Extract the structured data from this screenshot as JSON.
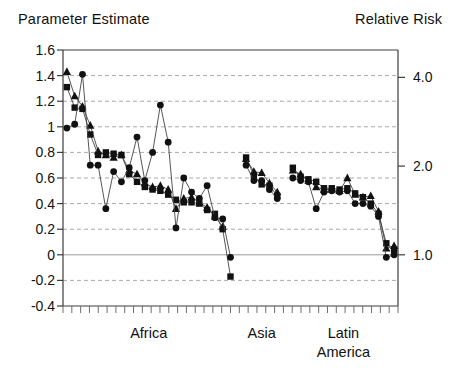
{
  "colors": {
    "background": "#ffffff",
    "ink": "#111111",
    "axis": "#3c3c3c",
    "grid": "#aaaaaa",
    "zero_line": "#979797"
  },
  "chart_data": {
    "type": "scatter",
    "title_left": "Parameter Estimate",
    "title_right": "Relative Risk",
    "y_axis_left": {
      "title": "Parameter Estimate",
      "range": [
        -0.4,
        1.6
      ],
      "tick_values": [
        1.6,
        1.4,
        1.2,
        1,
        0.8,
        0.6,
        0.4,
        0.2,
        0,
        -0.2,
        -0.4
      ],
      "tick_labels": [
        "1.6",
        "1.4",
        "1.2",
        "1",
        "0.8",
        "0.6",
        "0.4",
        "0.2",
        "0",
        "-0.2",
        "-0.4"
      ],
      "gridlines": "dashed at each 0.2 step, solid line at 0, solid border at 1.6 and -0.4"
    },
    "y_axis_right": {
      "title": "Relative Risk",
      "tick_values": [
        4.0,
        2.0,
        1.0
      ],
      "tick_labels": [
        "4.0",
        "2.0",
        "1.0"
      ],
      "scale": "logarithmic: relative risk = exp(parameter estimate)"
    },
    "x_axis": {
      "description": "one unlabeled minor tick per study, studies grouped by region",
      "regions": [
        {
          "id": "africa",
          "label_lines": [
            "Africa"
          ]
        },
        {
          "id": "asia",
          "label_lines": [
            "Asia"
          ]
        },
        {
          "id": "latin-america",
          "label_lines": [
            "Latin",
            "America"
          ]
        }
      ]
    },
    "series": [
      {
        "marker": "filled-triangle",
        "values": [
          [
            1.43,
            1.24,
            1.16,
            1.01,
            0.81,
            0.78,
            0.76,
            0.78,
            0.66,
            0.63,
            0.56,
            0.53,
            0.54,
            0.51,
            0.36,
            0.44,
            0.45,
            0.41,
            0.37,
            0.3,
            0.22,
            null
          ],
          [
            0.75,
            0.65,
            0.64,
            0.56,
            0.49
          ],
          [
            0.66,
            0.63,
            0.58,
            0.53,
            0.51,
            0.51,
            0.5,
            0.6,
            0.47,
            0.45,
            0.46,
            0.34,
            0.05,
            0.07
          ]
        ]
      },
      {
        "marker": "filled-square",
        "values": [
          [
            1.31,
            1.15,
            1.14,
            0.94,
            0.78,
            0.8,
            0.79,
            0.78,
            0.63,
            0.57,
            0.53,
            0.51,
            0.5,
            0.47,
            0.43,
            0.41,
            0.41,
            0.4,
            0.35,
            0.32,
            0.2,
            -0.17
          ],
          [
            0.76,
            0.62,
            0.55,
            0.54,
            0.46
          ],
          [
            0.68,
            0.61,
            0.59,
            0.57,
            0.52,
            0.52,
            0.51,
            0.52,
            0.48,
            0.45,
            0.4,
            0.32,
            0.09,
            0.04
          ]
        ]
      },
      {
        "marker": "filled-circle",
        "values": [
          [
            0.99,
            1.02,
            1.41,
            0.7,
            0.7,
            0.36,
            0.65,
            0.57,
            0.68,
            0.92,
            0.58,
            0.8,
            1.17,
            0.88,
            0.21,
            0.6,
            0.49,
            0.44,
            0.54,
            0.29,
            0.28,
            -0.02
          ],
          [
            0.7,
            0.58,
            0.58,
            0.51,
            0.44
          ],
          [
            0.6,
            0.58,
            0.57,
            0.36,
            0.49,
            0.5,
            0.49,
            0.5,
            0.4,
            0.4,
            0.38,
            0.3,
            -0.02,
            0.0
          ]
        ]
      }
    ]
  }
}
